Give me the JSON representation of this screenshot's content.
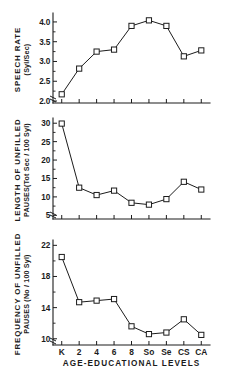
{
  "figure": {
    "xlabel": "AGE-EDUCATIONAL LEVELS",
    "categories": [
      "K",
      "2",
      "4",
      "6",
      "8",
      "So",
      "Se",
      "CS",
      "CA"
    ]
  },
  "chart_data": [
    {
      "type": "line",
      "title": "SPEECH RATE",
      "ylabel_main": "SPEECH RATE",
      "ylabel_units": "(Syl/Sec)",
      "xlabel": "AGE-EDUCATIONAL LEVELS",
      "categories": [
        "K",
        "2",
        "4",
        "6",
        "8",
        "So",
        "Se",
        "CS",
        "CA"
      ],
      "values": [
        2.17,
        2.82,
        3.25,
        3.3,
        3.9,
        4.04,
        3.9,
        3.13,
        3.28
      ],
      "yticks": [
        2.0,
        2.5,
        3.0,
        3.5,
        4.0
      ],
      "ytick_labels": [
        "2.0",
        "2.5",
        "3.0",
        "3.5",
        "4.0"
      ],
      "ylim": [
        1.95,
        4.15
      ],
      "grid": false,
      "legend": "none",
      "axis_break": true
    },
    {
      "type": "line",
      "title": "LENGTH OF UNFILLED PAUSES",
      "ylabel_main": "LENGTH OF UNFILLED",
      "ylabel_units": "PAUSES(Tot Sec / 100 Syl)",
      "xlabel": "AGE-EDUCATIONAL LEVELS",
      "categories": [
        "K",
        "2",
        "4",
        "6",
        "8",
        "So",
        "Se",
        "CS",
        "CA"
      ],
      "values": [
        29.9,
        12.5,
        10.5,
        11.7,
        8.4,
        7.9,
        9.4,
        14.1,
        12.0
      ],
      "yticks": [
        5,
        10,
        15,
        20,
        25,
        30
      ],
      "ytick_labels": [
        "5",
        "10",
        "15",
        "20",
        "25",
        "30"
      ],
      "ylim": [
        4.0,
        30.6
      ],
      "grid": false,
      "legend": "none",
      "axis_break": true
    },
    {
      "type": "line",
      "title": "FREQUENCY OF UNFILLED PAUSES",
      "ylabel_main": "FREQUENCY OF UNFILLED",
      "ylabel_units": "PAUSES (No / 100 Syl)",
      "xlabel": "AGE-EDUCATIONAL LEVELS",
      "categories": [
        "K",
        "2",
        "4",
        "6",
        "8",
        "So",
        "Se",
        "CS",
        "CA"
      ],
      "values": [
        20.5,
        14.7,
        14.9,
        15.1,
        11.6,
        10.6,
        10.8,
        12.5,
        10.5
      ],
      "yticks": [
        10,
        14,
        18,
        22
      ],
      "ytick_labels": [
        "10",
        "14",
        "18",
        "22"
      ],
      "ylim": [
        9.2,
        22.3
      ],
      "grid": false,
      "legend": "none",
      "axis_break": true
    }
  ]
}
